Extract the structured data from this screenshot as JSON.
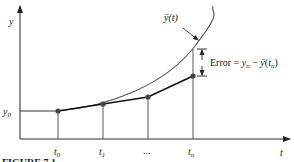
{
  "diagram": {
    "type": "euler-method-error",
    "axes": {
      "x_label": "t",
      "y_label": "y",
      "y0_label": "y0",
      "tick_labels": [
        "t0",
        "t1",
        "...",
        "tn"
      ]
    },
    "curve_label": "ȳ(t)",
    "error_label": "Error = yn − ȳ(tn)",
    "caption": "FIGURE 7.1",
    "colors": {
      "axis": "#333333",
      "curve": "#555555",
      "approx_line": "#111111",
      "point": "#444444"
    }
  }
}
